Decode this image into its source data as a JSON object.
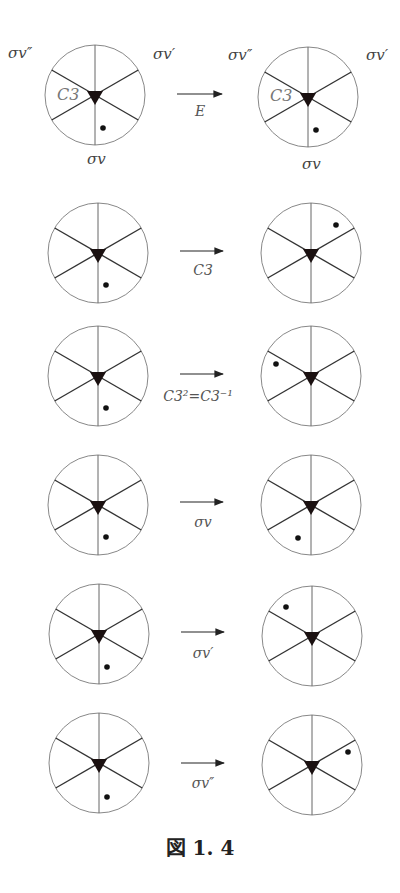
{
  "figure": {
    "caption": "図 1. 4",
    "labels": {
      "sigma_v_double_prime": "σv″",
      "sigma_v_prime": "σv′",
      "sigma_v": "σv",
      "c3": "C3"
    },
    "operations": [
      {
        "label": "E",
        "before_dot": "lower-right",
        "after_dot": "lower-right"
      },
      {
        "label": "C3",
        "before_dot": "lower-right",
        "after_dot": "upper-right"
      },
      {
        "label": "C3²=C3⁻¹",
        "before_dot": "lower-right",
        "after_dot": "upper-left"
      },
      {
        "label": "σv",
        "before_dot": "lower-right",
        "after_dot": "lower-left"
      },
      {
        "label": "σv′",
        "before_dot": "lower-right",
        "after_dot": "upper-left"
      },
      {
        "label": "σv″",
        "before_dot": "lower-right",
        "after_dot": "right"
      }
    ]
  }
}
